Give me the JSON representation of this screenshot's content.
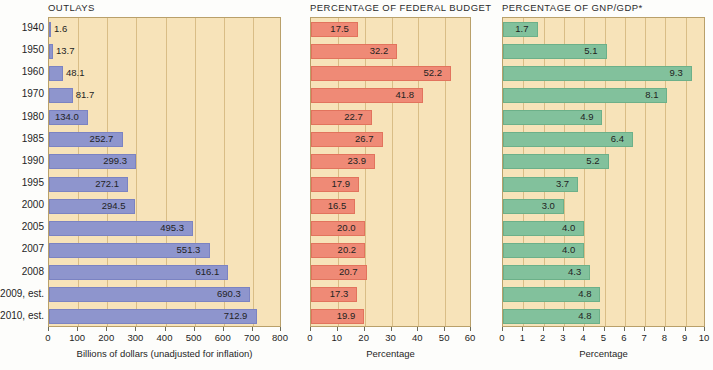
{
  "figure": {
    "background_color": "#fdfdfb",
    "plot_background_color": "#f7e3b9",
    "gridline_color": "#d9bd86",
    "border_color": "#b9a06a"
  },
  "categories": [
    "1940",
    "1950",
    "1960",
    "1970",
    "1980",
    "1985",
    "1990",
    "1995",
    "2000",
    "2005",
    "2007",
    "2008",
    "2009, est.",
    "2010, est."
  ],
  "chart_data": [
    {
      "type": "bar",
      "orientation": "horizontal",
      "title": "OUTLAYS",
      "xlabel": "Billions of dollars (unadjusted for inflation)",
      "ylabel": "",
      "xlim": [
        0,
        800
      ],
      "xticks": [
        0,
        100,
        200,
        300,
        400,
        500,
        600,
        700,
        800
      ],
      "xticklabels": [
        "0",
        "100",
        "200",
        "300",
        "400",
        "500",
        "600",
        "700",
        "800"
      ],
      "grid": true,
      "legend": "none",
      "bar_color": "#8e95cd",
      "categories": [
        "1940",
        "1950",
        "1960",
        "1970",
        "1980",
        "1985",
        "1990",
        "1995",
        "2000",
        "2005",
        "2007",
        "2008",
        "2009, est.",
        "2010, est."
      ],
      "values": [
        1.6,
        13.7,
        48.1,
        81.7,
        134.0,
        252.7,
        299.3,
        272.1,
        294.5,
        495.3,
        551.3,
        616.1,
        690.3,
        712.9
      ],
      "value_labels": [
        "1.6",
        "13.7",
        "48.1",
        "81.7",
        "134.0",
        "252.7",
        "299.3",
        "272.1",
        "294.5",
        "495.3",
        "551.3",
        "616.1",
        "690.3",
        "712.9"
      ]
    },
    {
      "type": "bar",
      "orientation": "horizontal",
      "title": "PERCENTAGE OF FEDERAL BUDGET",
      "xlabel": "Percentage",
      "ylabel": "",
      "xlim": [
        0,
        60
      ],
      "xticks": [
        0,
        10,
        20,
        30,
        40,
        50,
        60
      ],
      "xticklabels": [
        "0",
        "10",
        "20",
        "30",
        "40",
        "50",
        "60"
      ],
      "grid": true,
      "legend": "none",
      "bar_color": "#ef8a76",
      "categories": [
        "1940",
        "1950",
        "1960",
        "1970",
        "1980",
        "1985",
        "1990",
        "1995",
        "2000",
        "2005",
        "2007",
        "2008",
        "2009, est.",
        "2010, est."
      ],
      "values": [
        17.5,
        32.2,
        52.2,
        41.8,
        22.7,
        26.7,
        23.9,
        17.9,
        16.5,
        20.0,
        20.2,
        20.7,
        17.3,
        19.9
      ],
      "value_labels": [
        "17.5",
        "32.2",
        "52.2",
        "41.8",
        "22.7",
        "26.7",
        "23.9",
        "17.9",
        "16.5",
        "20.0",
        "20.2",
        "20.7",
        "17.3",
        "19.9"
      ]
    },
    {
      "type": "bar",
      "orientation": "horizontal",
      "title": "PERCENTAGE OF GNP/GDP*",
      "xlabel": "Percentage",
      "ylabel": "",
      "xlim": [
        0,
        10
      ],
      "xticks": [
        0,
        1,
        2,
        3,
        4,
        5,
        6,
        7,
        8,
        9,
        10
      ],
      "xticklabels": [
        "0",
        "1",
        "2",
        "3",
        "4",
        "5",
        "6",
        "7",
        "8",
        "9",
        "10"
      ],
      "grid": true,
      "legend": "none",
      "bar_color": "#82c19c",
      "categories": [
        "1940",
        "1950",
        "1960",
        "1970",
        "1980",
        "1985",
        "1990",
        "1995",
        "2000",
        "2005",
        "2007",
        "2008",
        "2009, est.",
        "2010, est."
      ],
      "values": [
        1.7,
        5.1,
        9.3,
        8.1,
        4.9,
        6.4,
        5.2,
        3.7,
        3.0,
        4.0,
        4.0,
        4.3,
        4.8,
        4.8
      ],
      "value_labels": [
        "1.7",
        "5.1",
        "9.3",
        "8.1",
        "4.9",
        "6.4",
        "5.2",
        "3.7",
        "3.0",
        "4.0",
        "4.0",
        "4.3",
        "4.8",
        "4.8"
      ]
    }
  ]
}
